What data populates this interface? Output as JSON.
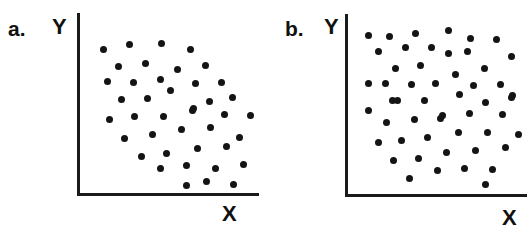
{
  "figure": {
    "background_color": "#ffffff",
    "ink_color": "#141414",
    "width": 527,
    "height": 249
  },
  "panels": [
    {
      "id": "panel-a",
      "label": "a.",
      "label_pos": {
        "x": 8,
        "y": 18
      },
      "y_axis_label": "Y",
      "y_axis_label_pos": {
        "x": 52,
        "y": 16
      },
      "x_axis_label": "X",
      "x_axis_label_pos": {
        "x": 222,
        "y": 203
      },
      "axes": {
        "y_axis": {
          "x": 77,
          "y_top": 13,
          "y_bottom": 196
        },
        "x_axis": {
          "y": 193,
          "x_left": 77,
          "x_right": 259
        }
      },
      "chart_data": {
        "type": "scatter",
        "title": "a.",
        "xlabel": "X",
        "ylabel": "Y",
        "grid": false,
        "legend": "none",
        "n_points": 49,
        "description": "Scattered points filling the upper-left to mid region, thinning toward the lower-left corner",
        "points": [
          {
            "x": 103,
            "y": 49
          },
          {
            "x": 129,
            "y": 44
          },
          {
            "x": 161,
            "y": 43
          },
          {
            "x": 190,
            "y": 49
          },
          {
            "x": 118,
            "y": 66
          },
          {
            "x": 145,
            "y": 63
          },
          {
            "x": 177,
            "y": 69
          },
          {
            "x": 205,
            "y": 65
          },
          {
            "x": 107,
            "y": 81
          },
          {
            "x": 133,
            "y": 82
          },
          {
            "x": 160,
            "y": 79
          },
          {
            "x": 195,
            "y": 83
          },
          {
            "x": 221,
            "y": 82
          },
          {
            "x": 121,
            "y": 99
          },
          {
            "x": 147,
            "y": 98
          },
          {
            "x": 170,
            "y": 90
          },
          {
            "x": 193,
            "y": 108
          },
          {
            "x": 209,
            "y": 101
          },
          {
            "x": 232,
            "y": 97
          },
          {
            "x": 109,
            "y": 119
          },
          {
            "x": 134,
            "y": 116
          },
          {
            "x": 163,
            "y": 116
          },
          {
            "x": 192,
            "y": 110
          },
          {
            "x": 224,
            "y": 114
          },
          {
            "x": 250,
            "y": 115
          },
          {
            "x": 124,
            "y": 138
          },
          {
            "x": 152,
            "y": 134
          },
          {
            "x": 181,
            "y": 129
          },
          {
            "x": 210,
            "y": 127
          },
          {
            "x": 239,
            "y": 137
          },
          {
            "x": 141,
            "y": 156
          },
          {
            "x": 166,
            "y": 153
          },
          {
            "x": 197,
            "y": 148
          },
          {
            "x": 226,
            "y": 146
          },
          {
            "x": 160,
            "y": 168
          },
          {
            "x": 186,
            "y": 165
          },
          {
            "x": 215,
            "y": 168
          },
          {
            "x": 243,
            "y": 164
          },
          {
            "x": 186,
            "y": 185
          },
          {
            "x": 206,
            "y": 181
          },
          {
            "x": 233,
            "y": 184
          }
        ]
      }
    },
    {
      "id": "panel-b",
      "label": "b.",
      "label_pos": {
        "x": 285,
        "y": 18
      },
      "y_axis_label": "Y",
      "y_axis_label_pos": {
        "x": 324,
        "y": 16
      },
      "x_axis_label": "X",
      "x_axis_label_pos": {
        "x": 502,
        "y": 207
      },
      "axes": {
        "y_axis": {
          "x": 345,
          "y_top": 14,
          "y_bottom": 197
        },
        "x_axis": {
          "y": 194,
          "x_left": 345,
          "x_right": 527
        }
      },
      "chart_data": {
        "type": "scatter",
        "title": "b.",
        "xlabel": "X",
        "ylabel": "Y",
        "grid": false,
        "legend": "none",
        "n_points": 53,
        "description": "Points uniformly scattered across the whole plotting region",
        "points": [
          {
            "x": 368,
            "y": 35
          },
          {
            "x": 389,
            "y": 36
          },
          {
            "x": 415,
            "y": 33
          },
          {
            "x": 448,
            "y": 30
          },
          {
            "x": 470,
            "y": 38
          },
          {
            "x": 496,
            "y": 39
          },
          {
            "x": 378,
            "y": 51
          },
          {
            "x": 405,
            "y": 47
          },
          {
            "x": 431,
            "y": 47
          },
          {
            "x": 448,
            "y": 53
          },
          {
            "x": 467,
            "y": 51
          },
          {
            "x": 511,
            "y": 56
          },
          {
            "x": 395,
            "y": 68
          },
          {
            "x": 420,
            "y": 65
          },
          {
            "x": 484,
            "y": 68
          },
          {
            "x": 455,
            "y": 74
          },
          {
            "x": 368,
            "y": 83
          },
          {
            "x": 385,
            "y": 83
          },
          {
            "x": 411,
            "y": 84
          },
          {
            "x": 435,
            "y": 83
          },
          {
            "x": 473,
            "y": 85
          },
          {
            "x": 500,
            "y": 84
          },
          {
            "x": 392,
            "y": 100
          },
          {
            "x": 459,
            "y": 94
          },
          {
            "x": 512,
            "y": 95
          },
          {
            "x": 397,
            "y": 100
          },
          {
            "x": 424,
            "y": 100
          },
          {
            "x": 485,
            "y": 102
          },
          {
            "x": 511,
            "y": 97
          },
          {
            "x": 368,
            "y": 110
          },
          {
            "x": 386,
            "y": 122
          },
          {
            "x": 414,
            "y": 119
          },
          {
            "x": 440,
            "y": 118
          },
          {
            "x": 442,
            "y": 115
          },
          {
            "x": 469,
            "y": 113
          },
          {
            "x": 502,
            "y": 114
          },
          {
            "x": 378,
            "y": 142
          },
          {
            "x": 401,
            "y": 140
          },
          {
            "x": 427,
            "y": 137
          },
          {
            "x": 458,
            "y": 132
          },
          {
            "x": 487,
            "y": 132
          },
          {
            "x": 518,
            "y": 134
          },
          {
            "x": 393,
            "y": 160
          },
          {
            "x": 418,
            "y": 158
          },
          {
            "x": 446,
            "y": 152
          },
          {
            "x": 475,
            "y": 150
          },
          {
            "x": 505,
            "y": 147
          },
          {
            "x": 409,
            "y": 178
          },
          {
            "x": 437,
            "y": 170
          },
          {
            "x": 464,
            "y": 168
          },
          {
            "x": 492,
            "y": 169
          },
          {
            "x": 485,
            "y": 184
          }
        ]
      }
    }
  ]
}
